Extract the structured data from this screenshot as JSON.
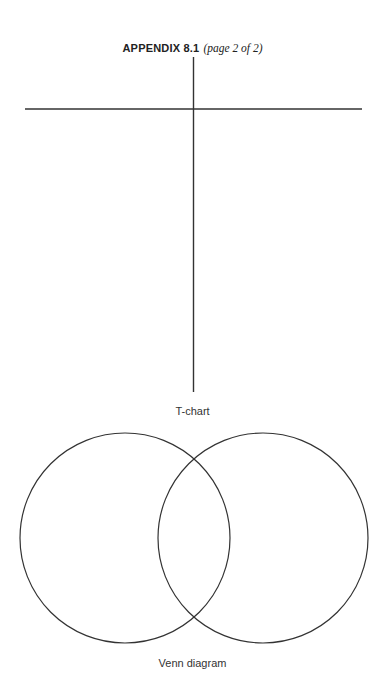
{
  "header": {
    "title_bold": "APPENDIX 8.1",
    "title_italic": "(page 2 of 2)"
  },
  "tchart": {
    "label": "T-chart"
  },
  "venn": {
    "label": "Venn diagram"
  },
  "colors": {
    "line": "#333333",
    "background": "#ffffff"
  }
}
